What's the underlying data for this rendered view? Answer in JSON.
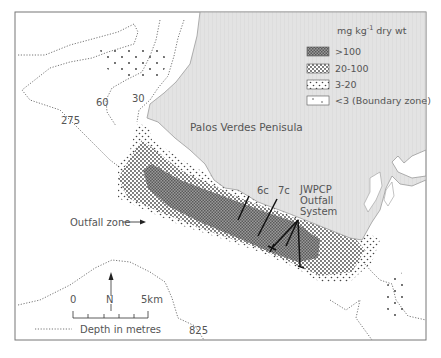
{
  "map": {
    "land_label": "Palos Verdes Penisula",
    "outfall_zone_label": "Outfall zone",
    "station_labels": [
      "6c",
      "7c"
    ],
    "outfall_system_label": [
      "JWPCP",
      "Outfall",
      "System"
    ],
    "depth_contours": [
      {
        "label": "275"
      },
      {
        "label": "60"
      },
      {
        "label": "30"
      },
      {
        "label": "825"
      }
    ]
  },
  "legend": {
    "title_prefix": "mg kg",
    "title_superscript": "-1",
    "title_suffix": "dry wt",
    "items": [
      {
        "label": ">100",
        "pattern": "dense"
      },
      {
        "label": "20-100",
        "pattern": "medium"
      },
      {
        "label": "3-20",
        "pattern": "sparse"
      },
      {
        "label": "<3 (Boundary zone)",
        "pattern": "boundary"
      }
    ]
  },
  "scale": {
    "start_label": "0",
    "end_label": "5km",
    "north_label": "N",
    "depth_key_label": "Depth in metres"
  },
  "colors": {
    "land": "#e3e3e3",
    "land_edge": "#9a9a9a",
    "dense_zone": "#8a8a8a",
    "frame": "#777777",
    "text": "#555555"
  }
}
